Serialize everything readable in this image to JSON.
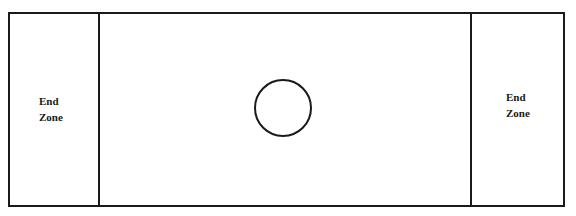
{
  "diagram": {
    "type": "playing-field",
    "left_zone": {
      "line1": "End",
      "line2": "Zone"
    },
    "right_zone": {
      "line1": "End",
      "line2": "Zone"
    },
    "center_marker": "circle",
    "line_color": "#1a1a1a",
    "background": "#ffffff"
  }
}
